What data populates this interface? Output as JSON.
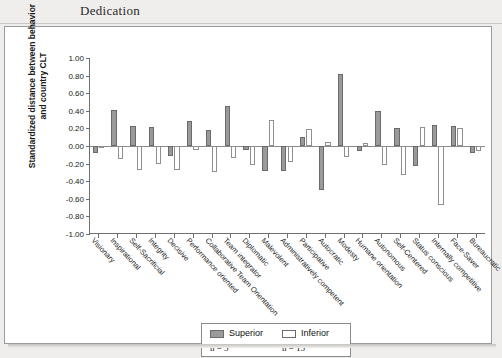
{
  "page": {
    "running_head": "Dedication"
  },
  "legend": {
    "superior": {
      "label": "Superior",
      "n_text": "n = 5",
      "color": "#9a9a9a"
    },
    "inferior": {
      "label": "Inferior",
      "n_text": "n = 15",
      "color": "#ffffff"
    }
  },
  "chart_data": {
    "type": "bar",
    "title": "",
    "xlabel": "",
    "ylabel": "Standardized distance between behavior and country CLT",
    "ylabel_line1": "Standardized distance between behavior",
    "ylabel_line2": "and country CLT",
    "ylim": [
      -1.0,
      1.0
    ],
    "ytick_step": 0.2,
    "ytick_labels": [
      "1.00",
      "0.80",
      "0.60",
      "0.40",
      "0.20",
      "0.00",
      "-0.20",
      "-0.40",
      "-0.60",
      "-0.80",
      "-1.00"
    ],
    "ytick_values": [
      1.0,
      0.8,
      0.6,
      0.4,
      0.2,
      0.0,
      -0.2,
      -0.4,
      -0.6,
      -0.8,
      -1.0
    ],
    "grid": false,
    "legend_position": "bottom-center",
    "categories": [
      "Visionary",
      "Inspirational",
      "Self-Sacrificial",
      "Integrity",
      "Decisive",
      "Performance oriented",
      "Collaborative Team Orientation",
      "Team integrator",
      "Diplomatic",
      "Malevolent",
      "Administratively competent",
      "Participative",
      "Autocratic",
      "Modesty",
      "Humane orientation",
      "Autonomous",
      "Self-Centered",
      "Status conscious",
      "Internally competitive",
      "Face-Saver",
      "Bureaucratic"
    ],
    "series": [
      {
        "name": "Superior",
        "n": 5,
        "color": "#9a9a9a",
        "values": [
          -0.08,
          0.41,
          0.23,
          0.22,
          -0.11,
          0.28,
          0.18,
          0.46,
          -0.04,
          -0.28,
          -0.28,
          0.1,
          -0.5,
          0.82,
          -0.06,
          0.4,
          0.2,
          -0.23,
          0.24,
          0.23,
          -0.08
        ]
      },
      {
        "name": "Inferior",
        "n": 15,
        "color": "#ffffff",
        "values": [
          0.0,
          -0.15,
          -0.27,
          -0.2,
          -0.27,
          -0.05,
          -0.3,
          -0.14,
          -0.22,
          0.3,
          -0.18,
          0.19,
          0.04,
          -0.13,
          0.03,
          -0.22,
          -0.33,
          0.22,
          -0.67,
          0.21,
          -0.06
        ]
      }
    ]
  }
}
